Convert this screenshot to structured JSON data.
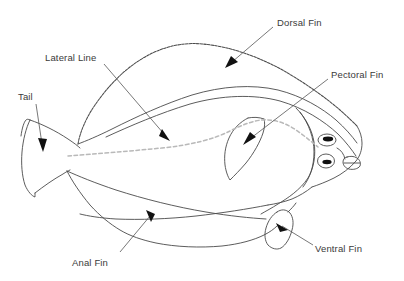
{
  "diagram": {
    "background_color": "#ffffff",
    "outline_color": "#4a4a4a",
    "lateral_line_color": "#b9b9b9",
    "label_color": "#3a3a3a",
    "leader_color": "#555555",
    "labels": [
      {
        "id": "dorsal-fin",
        "text": "Dorsal Fin"
      },
      {
        "id": "pectoral-fin",
        "text": "Pectoral Fin"
      },
      {
        "id": "lateral-line",
        "text": "Lateral Line"
      },
      {
        "id": "tail",
        "text": "Tail"
      },
      {
        "id": "anal-fin",
        "text": "Anal Fin"
      },
      {
        "id": "ventral-fin",
        "text": "Ventral Fin"
      }
    ],
    "parts": [
      {
        "id": "body",
        "name": "Body"
      },
      {
        "id": "dorsal-fin",
        "name": "Dorsal Fin"
      },
      {
        "id": "anal-fin",
        "name": "Anal Fin"
      },
      {
        "id": "pectoral-fin",
        "name": "Pectoral Fin"
      },
      {
        "id": "ventral-fin",
        "name": "Ventral Fin"
      },
      {
        "id": "tail-fin",
        "name": "Tail"
      },
      {
        "id": "lateral-line",
        "name": "Lateral Line"
      },
      {
        "id": "upper-eye",
        "name": "Upper Eye"
      },
      {
        "id": "lower-eye",
        "name": "Lower Eye"
      },
      {
        "id": "mouth",
        "name": "Mouth"
      }
    ]
  }
}
